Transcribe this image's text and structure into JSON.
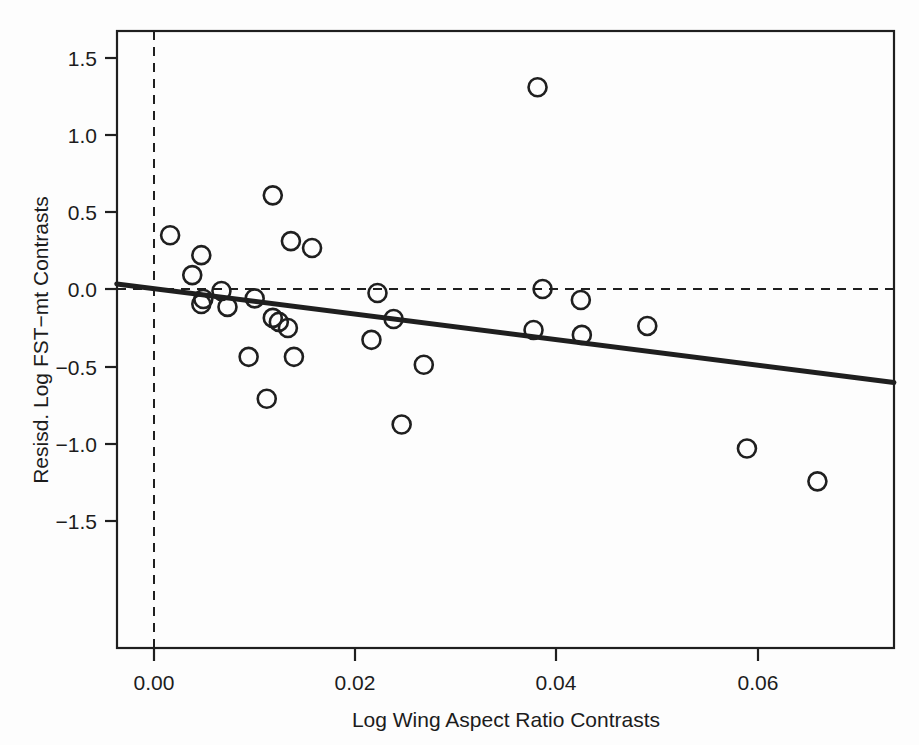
{
  "chart_data": {
    "type": "scatter",
    "title": "",
    "xlabel": "Log Wing Aspect Ratio Contrasts",
    "ylabel": "Resisd. Log FST−mt Contrasts",
    "xlim": [
      -0.0037,
      0.0735
    ],
    "ylim": [
      -1.66,
      1.66
    ],
    "xticks": [
      0.0,
      0.02,
      0.04,
      0.06
    ],
    "xtick_labels": [
      "0.00",
      "0.02",
      "0.04",
      "0.06"
    ],
    "yticks": [
      -1.5,
      -1.0,
      -0.5,
      0.0,
      0.5,
      1.0,
      1.5
    ],
    "ytick_labels": [
      "−1.5",
      "−1.0",
      "−0.5",
      "0.0",
      "0.5",
      "1.0",
      "1.5"
    ],
    "grid": false,
    "legend": "none",
    "marker": "open-circle",
    "marker_size": 9,
    "point_color": "#1f1f1f",
    "line_color": "#1f1f1f",
    "reference_lines": [
      {
        "name": "horizontal-zero-line",
        "orientation": "horizontal",
        "value": 0.0,
        "style": "dashed"
      },
      {
        "name": "vertical-zero-line",
        "orientation": "vertical",
        "value": 0.0,
        "style": "dashed"
      }
    ],
    "fit_line": {
      "name": "regression-line",
      "style": "solid",
      "x_start": -0.0037,
      "y_start": 0.033,
      "x_end": 0.0735,
      "y_end": -0.605,
      "slope": -8.264,
      "intercept": 0.0024
    },
    "points": [
      {
        "x": 0.0016,
        "y": 0.348
      },
      {
        "x": 0.0047,
        "y": 0.219
      },
      {
        "x": 0.0038,
        "y": 0.09
      },
      {
        "x": 0.0067,
        "y": -0.013
      },
      {
        "x": 0.0049,
        "y": -0.065
      },
      {
        "x": 0.0047,
        "y": -0.097
      },
      {
        "x": 0.0073,
        "y": -0.116
      },
      {
        "x": 0.01,
        "y": -0.061
      },
      {
        "x": 0.0118,
        "y": -0.187
      },
      {
        "x": 0.0124,
        "y": -0.213
      },
      {
        "x": 0.0118,
        "y": 0.606
      },
      {
        "x": 0.0136,
        "y": 0.31
      },
      {
        "x": 0.0157,
        "y": 0.265
      },
      {
        "x": 0.0094,
        "y": -0.439
      },
      {
        "x": 0.0139,
        "y": -0.439
      },
      {
        "x": 0.0112,
        "y": -0.71
      },
      {
        "x": 0.0133,
        "y": -0.252
      },
      {
        "x": 0.0222,
        "y": -0.026
      },
      {
        "x": 0.0238,
        "y": -0.194
      },
      {
        "x": 0.0216,
        "y": -0.329
      },
      {
        "x": 0.0246,
        "y": -0.877
      },
      {
        "x": 0.0268,
        "y": -0.49
      },
      {
        "x": 0.0381,
        "y": 1.306
      },
      {
        "x": 0.0386,
        "y": 0.0
      },
      {
        "x": 0.0424,
        "y": -0.071
      },
      {
        "x": 0.0377,
        "y": -0.265
      },
      {
        "x": 0.0425,
        "y": -0.297
      },
      {
        "x": 0.049,
        "y": -0.239
      },
      {
        "x": 0.0589,
        "y": -1.032
      },
      {
        "x": 0.0659,
        "y": -1.245
      }
    ]
  }
}
